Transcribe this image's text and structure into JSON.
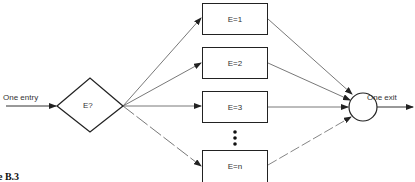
{
  "diagram": {
    "entry_label": "One entry",
    "decision_label": "E?",
    "cases": [
      {
        "label": "E=1"
      },
      {
        "label": "E=2"
      },
      {
        "label": "E=3"
      },
      {
        "label": "E=n"
      }
    ],
    "ellipsis": "⋮",
    "exit_label": "One exit",
    "figure_caption": "e B.3"
  }
}
